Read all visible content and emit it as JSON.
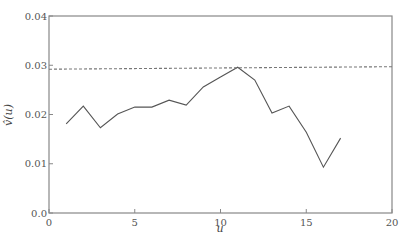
{
  "chart_data": {
    "type": "line",
    "title": "",
    "xlabel": "u",
    "ylabel": "v̂(u)",
    "xlim": [
      0,
      20
    ],
    "ylim": [
      0.0,
      0.04
    ],
    "xticks": [
      0,
      5,
      10,
      15,
      20
    ],
    "xtick_labels": [
      "0",
      "5",
      "10",
      "15",
      "20"
    ],
    "yticks": [
      0.0,
      0.01,
      0.02,
      0.03,
      0.04
    ],
    "ytick_labels": [
      "0.0",
      "0.01",
      "0.02",
      "0.03",
      "0.04"
    ],
    "grid": false,
    "legend": null,
    "series": [
      {
        "name": "v̂(u)",
        "style": "solid",
        "color": "#555555",
        "x": [
          1,
          2,
          3,
          4,
          5,
          6,
          7,
          8,
          9,
          10,
          11,
          12,
          13,
          14,
          15,
          16,
          17
        ],
        "y": [
          0.0181,
          0.0217,
          0.0173,
          0.0201,
          0.0215,
          0.0215,
          0.0229,
          0.0219,
          0.0256,
          0.0276,
          0.0296,
          0.027,
          0.0203,
          0.0217,
          0.0164,
          0.0093,
          0.0152
        ]
      },
      {
        "name": "reference",
        "style": "dashed",
        "color": "#777777",
        "x": [
          0,
          20
        ],
        "y": [
          0.0292,
          0.0297
        ]
      }
    ]
  }
}
